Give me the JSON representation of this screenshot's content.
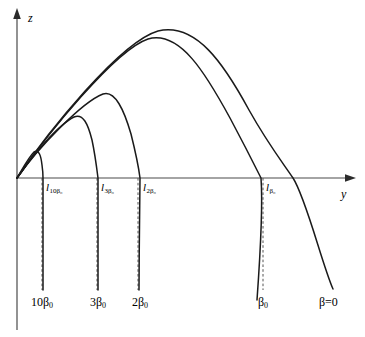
{
  "figure": {
    "type": "line-plot",
    "background_color": "#ffffff",
    "stroke_color": "#1a1a1a",
    "axis_color": "#4a4a4a"
  },
  "axes": {
    "vertical": {
      "name": "axis-z",
      "label": "z",
      "arrow": "up"
    },
    "horizontal": {
      "name": "axis-y",
      "label": "y",
      "arrow": "right"
    }
  },
  "axis_tick_labels": [
    {
      "id": "l-10b0",
      "base": "l",
      "sub": "10β₀",
      "x": 46,
      "y": 182
    },
    {
      "id": "l-3b0",
      "base": "l",
      "sub": "3β₀",
      "x": 101,
      "y": 182
    },
    {
      "id": "l-2b0",
      "base": "l",
      "sub": "2β₀",
      "x": 143,
      "y": 182
    },
    {
      "id": "l-b0",
      "base": "l",
      "sub": "β₀",
      "x": 266,
      "y": 182
    }
  ],
  "curve_labels": [
    {
      "id": "label-10beta0",
      "text": "10β",
      "sub": "0",
      "x": 31,
      "y": 296
    },
    {
      "id": "label-3beta0",
      "text": "3β",
      "sub": "0",
      "x": 90,
      "y": 296
    },
    {
      "id": "label-2beta0",
      "text": "2β",
      "sub": "0",
      "x": 132,
      "y": 296
    },
    {
      "id": "label-beta0",
      "text": "β",
      "sub": "0",
      "x": 258,
      "y": 296
    },
    {
      "id": "label-beta-eq-0",
      "text": "β=0",
      "sub": "",
      "x": 319,
      "y": 296
    }
  ],
  "chart_data": {
    "type": "line",
    "title": "",
    "xlabel": "y",
    "ylabel": "z",
    "grid": false,
    "legend": "inline-curve-labels",
    "xlim": [
      0,
      365
    ],
    "ylim": [
      0,
      337
    ],
    "origin_px": {
      "x": 17,
      "y": 178
    },
    "note": "Projectile trajectories z(y) with increasing drag coefficient β; each curve leaves the origin with the same initial slope, rises to an apex, then falls, crossing z=0 at a range l and continuing steeply downward.",
    "series": [
      {
        "name": "10β₀",
        "label": "10β₀",
        "range_label": "l_10β₀",
        "apex_px": {
          "x": 35,
          "y": 152
        },
        "zero_crossing_px": {
          "x": 43,
          "y": 178
        },
        "tail_end_px": {
          "x": 43,
          "y": 290
        },
        "path": "M17,178 C22,170 28,158 34,152 C39,149 41,156 42,165 C43,172 43,175 43,178 C43,200 43,250 43,290"
      },
      {
        "name": "3β₀",
        "label": "3β₀",
        "range_label": "l_3β₀",
        "apex_px": {
          "x": 80,
          "y": 118
        },
        "zero_crossing_px": {
          "x": 98,
          "y": 178
        },
        "tail_end_px": {
          "x": 98,
          "y": 290
        },
        "path": "M17,178 C32,156 58,125 74,117 C83,113 88,124 92,140 C95,154 97,170 98,178 C98,202 98,252 98,290"
      },
      {
        "name": "2β₀",
        "label": "2β₀",
        "range_label": "l_2β₀",
        "apex_px": {
          "x": 105,
          "y": 94
        },
        "zero_crossing_px": {
          "x": 140,
          "y": 178
        },
        "tail_end_px": {
          "x": 139,
          "y": 290
        },
        "path": "M17,178 C38,148 82,102 103,94 C115,90 124,110 131,134 C136,154 139,170 140,178 C140,202 139,252 139,290"
      },
      {
        "name": "β₀",
        "label": "β₀",
        "range_label": "l_β₀",
        "apex_px": {
          "x": 148,
          "y": 38
        },
        "zero_crossing_px": {
          "x": 262,
          "y": 178
        },
        "tail_end_px": {
          "x": 257,
          "y": 300
        },
        "path": "M17,178 C46,136 115,50 148,39 C180,30 206,74 230,118 C246,148 257,170 261,178 C263,205 260,258 257,300"
      },
      {
        "name": "β=0",
        "label": "β=0",
        "range_label": "",
        "apex_px": {
          "x": 158,
          "y": 30
        },
        "zero_crossing_px": {
          "x": 293,
          "y": 178
        },
        "tail_end_px": {
          "x": 333,
          "y": 289
        },
        "path": "M17,178 C48,132 120,42 158,31 C196,22 224,64 249,110 C268,144 283,163 293,178 C306,198 322,264 333,289"
      }
    ],
    "dashed_markers": [
      {
        "name": "dashed-10beta0",
        "x": 42,
        "y_top": 178,
        "y_bottom": 290
      },
      {
        "name": "dashed-3beta0",
        "x": 97,
        "y_top": 178,
        "y_bottom": 290
      },
      {
        "name": "dashed-2beta0",
        "x": 138,
        "y_top": 178,
        "y_bottom": 290
      },
      {
        "name": "dashed-beta0",
        "x": 263,
        "y_top": 178,
        "y_bottom": 290
      }
    ]
  }
}
